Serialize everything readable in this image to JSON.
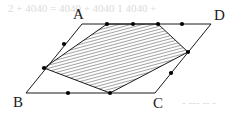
{
  "figure": {
    "canvas": {
      "width": 236,
      "height": 117,
      "background": "#ffffff"
    },
    "style": {
      "stroke_color": "#1a1a1a",
      "stroke_width": 1,
      "hatch_color": "#555555",
      "hatch_angle_deg": 75,
      "hatch_spacing": 3,
      "point_color": "#000000",
      "point_radius": 2.1,
      "bleed_color": "#cfcfcf"
    },
    "vertices": [
      {
        "id": "A",
        "label": "A",
        "x": 82,
        "y": 24,
        "label_x": 73,
        "label_y": 19
      },
      {
        "id": "D",
        "label": "D",
        "x": 211,
        "y": 24,
        "label_x": 214,
        "label_y": 20
      },
      {
        "id": "B",
        "label": "B",
        "x": 26,
        "y": 93,
        "label_x": 13,
        "label_y": 107
      },
      {
        "id": "C",
        "label": "C",
        "x": 155,
        "y": 93,
        "label_x": 153,
        "label_y": 108
      }
    ],
    "outline_edges": [
      {
        "name": "edge-AD",
        "from": "A",
        "to": "D"
      },
      {
        "name": "edge-AB",
        "from": "A",
        "to": "B"
      },
      {
        "name": "edge-BC",
        "from": "B",
        "to": "C"
      },
      {
        "name": "edge-CD",
        "from": "C",
        "to": "D"
      }
    ],
    "shaded_polygon": {
      "name": "shaded-quadrilateral",
      "fill": "hatch",
      "points": [
        {
          "x": 107,
          "y": 24
        },
        {
          "x": 158,
          "y": 24
        },
        {
          "x": 188,
          "y": 52
        },
        {
          "x": 110,
          "y": 93
        },
        {
          "x": 44,
          "y": 68
        }
      ]
    },
    "marked_points": [
      {
        "name": "point-ad-1",
        "x": 107,
        "y": 24,
        "on": "AD"
      },
      {
        "name": "point-ad-2",
        "x": 133,
        "y": 24,
        "on": "AD"
      },
      {
        "name": "point-ad-3",
        "x": 158,
        "y": 24,
        "on": "AD"
      },
      {
        "name": "point-ad-4",
        "x": 182,
        "y": 24,
        "on": "AD"
      },
      {
        "name": "point-ab-1",
        "x": 64,
        "y": 44,
        "on": "AB"
      },
      {
        "name": "point-ab-2",
        "x": 44,
        "y": 68,
        "on": "AB"
      },
      {
        "name": "point-bc-1",
        "x": 68,
        "y": 93,
        "on": "BC"
      },
      {
        "name": "point-bc-2",
        "x": 110,
        "y": 93,
        "on": "BC"
      },
      {
        "name": "point-cd-1",
        "x": 171,
        "y": 73,
        "on": "CD"
      },
      {
        "name": "point-cd-2",
        "x": 188,
        "y": 52,
        "on": "CD"
      }
    ],
    "bleed_through": [
      {
        "name": "bleed-line-top",
        "text": "2  +  4040  =  4040  +  4040   1   4040  +",
        "x": 8,
        "y": 12
      },
      {
        "name": "bleed-line-bottom",
        "text": "-  ---  -- -",
        "x": 182,
        "y": 106
      }
    ]
  }
}
